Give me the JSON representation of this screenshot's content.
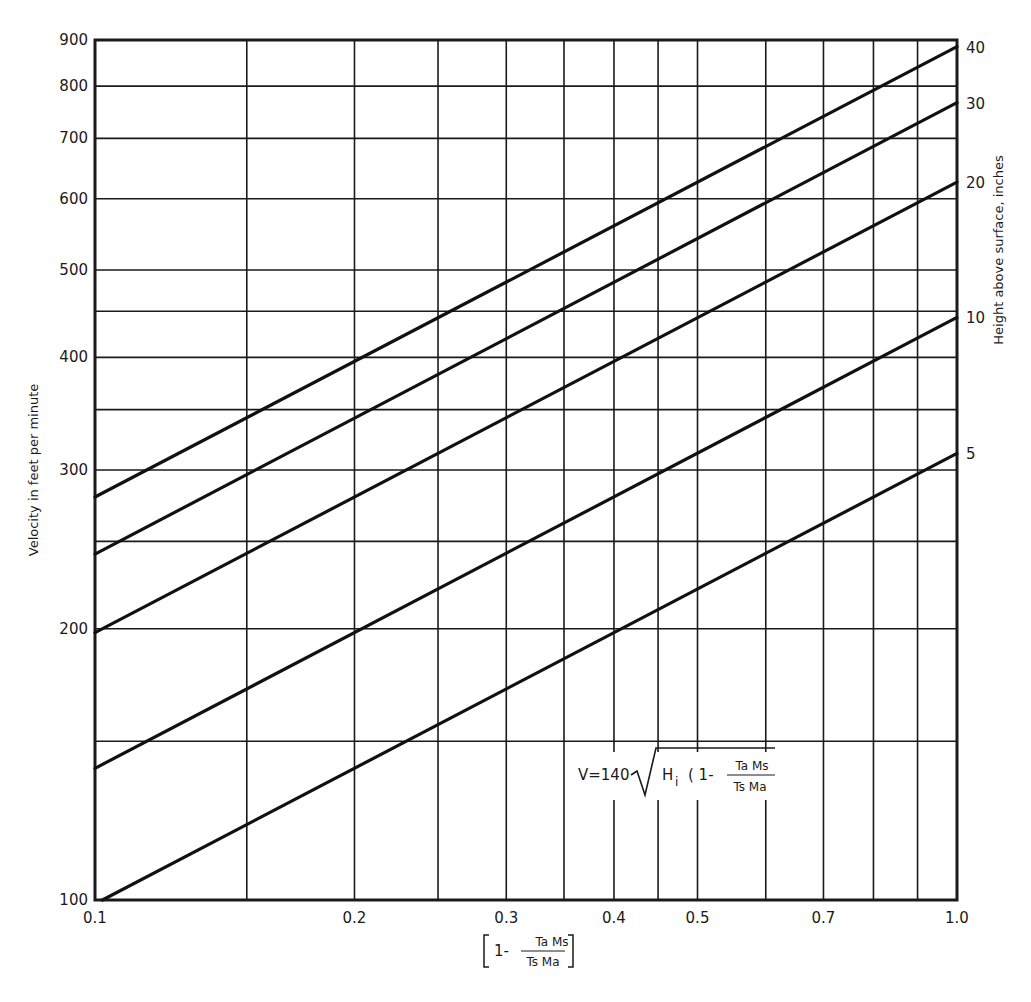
{
  "chart_data": {
    "type": "line",
    "title": "",
    "xlabel": "[ 1 - (Ta Ms)/(Ts Ma) ]",
    "ylabel": "Velocity in feet per minute",
    "y2label": "Height above surface, inches",
    "xscale": "log",
    "yscale": "log",
    "xlim": [
      0.1,
      1.0
    ],
    "ylim": [
      100,
      900
    ],
    "grid": true,
    "x_ticks": [
      0.1,
      0.2,
      0.3,
      0.4,
      0.5,
      0.7,
      1.0
    ],
    "x_tick_labels": [
      "0.1",
      "0.2",
      "0.3",
      "0.4",
      "0.5",
      "0.7",
      "1.0"
    ],
    "x_gridlines": [
      0.1,
      0.15,
      0.2,
      0.25,
      0.3,
      0.35,
      0.4,
      0.45,
      0.5,
      0.6,
      0.7,
      0.8,
      0.9,
      1.0
    ],
    "y_ticks": [
      100,
      200,
      300,
      400,
      500,
      600,
      700,
      800,
      900
    ],
    "y_tick_labels": [
      "100",
      "200",
      "300",
      "400",
      "500",
      "600",
      "700",
      "800",
      "900"
    ],
    "y_gridlines": [
      100,
      150,
      200,
      250,
      300,
      350,
      400,
      450,
      500,
      600,
      700,
      800,
      900
    ],
    "annotation": "V = 140 √( Hi ( 1 - (Ta Ms)/(Ts Ma) ) )",
    "series": [
      {
        "name": "40",
        "label": "40",
        "x": [
          0.1,
          1.0
        ],
        "y": [
          280,
          885
        ]
      },
      {
        "name": "30",
        "label": "30",
        "x": [
          0.1,
          1.0
        ],
        "y": [
          242,
          767
        ]
      },
      {
        "name": "20",
        "label": "20",
        "x": [
          0.1,
          1.0
        ],
        "y": [
          198,
          626
        ]
      },
      {
        "name": "10",
        "label": "10",
        "x": [
          0.1,
          1.0
        ],
        "y": [
          140,
          443
        ]
      },
      {
        "name": "5",
        "label": "5",
        "x": [
          0.102,
          1.0
        ],
        "y": [
          100,
          313
        ]
      }
    ]
  },
  "labels": {
    "ylabel": "Velocity in feet per minute",
    "y2label": "Height above surface, inches",
    "xlabel_prefix": "1-",
    "xlabel_num": "Ta Ms",
    "xlabel_den": "Ts Ma",
    "formula_lhs": "V=140",
    "formula_hi": "H",
    "formula_hi_sub": "i",
    "formula_paren": "( 1-",
    "formula_num": "Ta Ms",
    "formula_den": "Ts Ma"
  }
}
